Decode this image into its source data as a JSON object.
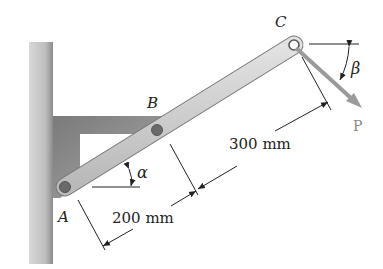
{
  "labels": {
    "A": "A",
    "B": "B",
    "C": "C",
    "P": "P",
    "alpha": "α",
    "beta": "β"
  },
  "dimensions": {
    "AB": "200 mm",
    "BC": "300 mm"
  },
  "colors": {
    "wall": "#b9b9b9",
    "bracket": "#8c8c8c",
    "bar": "#cfcfcf",
    "force": "#9a9a9a",
    "line": "#222222"
  }
}
